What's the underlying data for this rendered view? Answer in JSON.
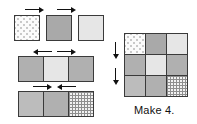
{
  "diagram": {
    "caption": "Make 4.",
    "fabrics": {
      "dotted": "dotted-cream",
      "medium_gray": "medium-gray",
      "light_gray": "light-gray",
      "gray": "gray",
      "gray_light": "gray-light",
      "plaid": "plaid-check"
    },
    "rows": [
      {
        "name": "row-1-units",
        "joined": false,
        "cells": [
          "dotted",
          "medium_gray",
          "light_gray"
        ],
        "arrows": [
          {
            "name": "press-arrow-row1-a",
            "direction": "right"
          },
          {
            "name": "press-arrow-row1-b",
            "direction": "right"
          }
        ]
      },
      {
        "name": "row-2-unit",
        "joined": true,
        "cells": [
          "gray",
          "light_gray",
          "gray"
        ],
        "arrows": [
          {
            "name": "press-arrow-row2-a",
            "direction": "left"
          },
          {
            "name": "press-arrow-row2-b",
            "direction": "right"
          }
        ]
      },
      {
        "name": "row-3-unit",
        "joined": true,
        "cells": [
          "gray_light",
          "gray",
          "plaid"
        ],
        "arrows": [
          {
            "name": "press-arrow-row3-a",
            "direction": "right"
          },
          {
            "name": "press-arrow-row3-b",
            "direction": "left"
          }
        ]
      }
    ],
    "block": {
      "name": "assembled-nine-patch",
      "grid": [
        [
          "dotted",
          "medium_gray",
          "light_gray"
        ],
        [
          "gray",
          "light_gray",
          "gray"
        ],
        [
          "gray_light",
          "gray",
          "plaid"
        ]
      ],
      "arrows": [
        {
          "name": "press-arrow-block-a",
          "direction": "down"
        },
        {
          "name": "press-arrow-block-b",
          "direction": "down"
        }
      ]
    },
    "colors": {
      "outline": "#3a3a3a",
      "arrow": "#111111",
      "dotted": "#fbfbfb",
      "medium_gray": "#a9a9a9",
      "light_gray": "#e6e6e6",
      "gray": "#b0b0b0",
      "gray_light": "#bcbcbc",
      "plaid": "#f2f2f2",
      "background": "#ffffff"
    }
  }
}
